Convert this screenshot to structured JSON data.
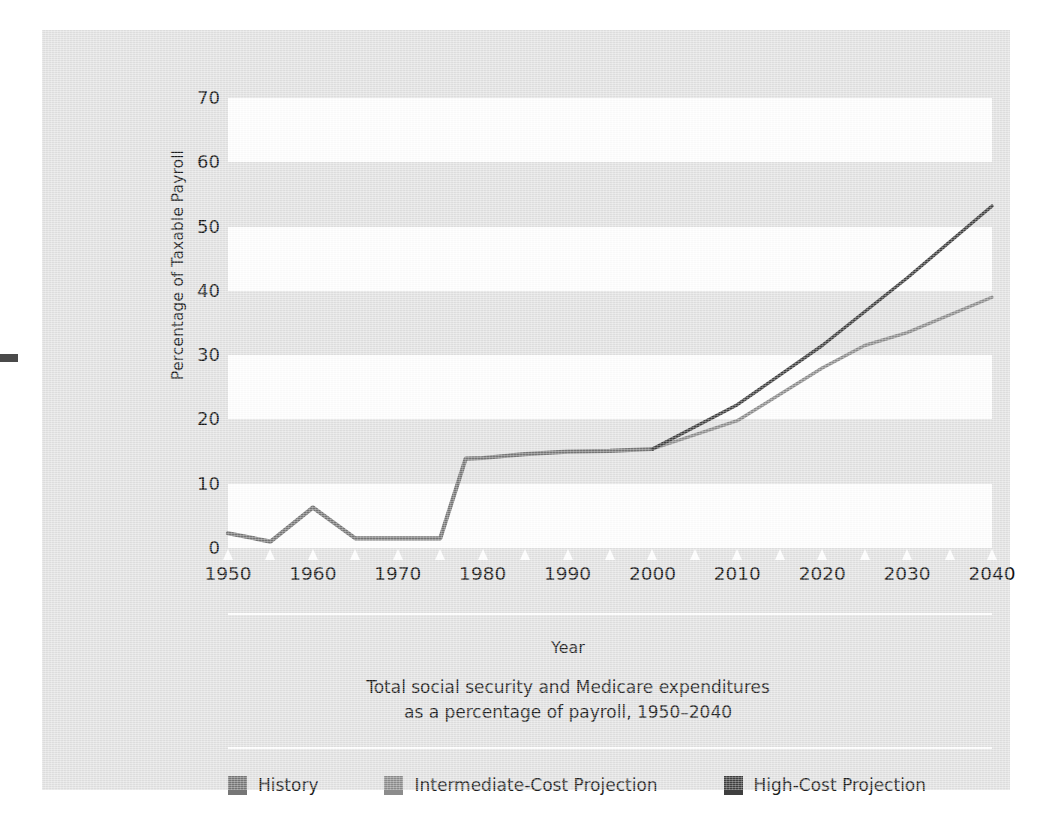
{
  "chart_data": {
    "type": "line",
    "caption_line1": "Total social security and Medicare expenditures",
    "caption_line2": "as a percentage of payroll, 1950–2040",
    "xlabel": "Year",
    "ylabel": "Percentage of Taxable Payroll",
    "xlim": [
      1950,
      2040
    ],
    "ylim": [
      0,
      70
    ],
    "grid": "alternating horizontal bands",
    "legend_position": "bottom",
    "y_ticks": [
      0,
      10,
      20,
      30,
      40,
      50,
      60,
      70
    ],
    "y_tick_labels": [
      "0",
      "10",
      "20",
      "30",
      "40",
      "50",
      "60",
      "70"
    ],
    "x_ticks": [
      1950,
      1955,
      1960,
      1965,
      1970,
      1975,
      1980,
      1985,
      1990,
      1995,
      2000,
      2005,
      2010,
      2015,
      2020,
      2025,
      2030,
      2035,
      2040
    ],
    "x_tick_labels": [
      "1950",
      "",
      "1960",
      "",
      "1970",
      "",
      "1980",
      "",
      "1990",
      "",
      "2000",
      "",
      "2010",
      "",
      "2020",
      "",
      "2030",
      "",
      "2040"
    ],
    "series": [
      {
        "name": "History",
        "color": "#767676",
        "x": [
          1950,
          1955,
          1960,
          1965,
          1970,
          1975,
          1978,
          1980,
          1985,
          1990,
          1995,
          2000
        ],
        "values": [
          2.3,
          1.0,
          6.3,
          1.5,
          1.5,
          1.5,
          13.9,
          14.0,
          14.6,
          15.0,
          15.1,
          15.4
        ]
      },
      {
        "name": "Intermediate-Cost Projection",
        "color": "#8c8c8c",
        "x": [
          2000,
          2010,
          2020,
          2025,
          2030,
          2040
        ],
        "values": [
          15.4,
          19.8,
          28.0,
          31.5,
          33.5,
          39.0
        ]
      },
      {
        "name": "High-Cost Projection",
        "color": "#3f3f3f",
        "x": [
          2000,
          2010,
          2020,
          2030,
          2040
        ],
        "values": [
          15.4,
          22.3,
          31.5,
          42.0,
          53.2
        ]
      }
    ],
    "bands": [
      {
        "from": 60,
        "to": 70
      },
      {
        "from": 40,
        "to": 50
      },
      {
        "from": 20,
        "to": 30
      },
      {
        "from": 0,
        "to": 10
      }
    ]
  },
  "legend": {
    "items": [
      {
        "label": "History",
        "color": "#767676"
      },
      {
        "label": "Intermediate-Cost Projection",
        "color": "#8c8c8c"
      },
      {
        "label": "High-Cost Projection",
        "color": "#3f3f3f"
      }
    ]
  },
  "colors": {
    "panel_background": "#e2e2e2",
    "band_white": "#ffffff",
    "text": "#1b1b1b",
    "history": "#767676",
    "intermediate": "#8c8c8c",
    "high_cost": "#3f3f3f"
  }
}
